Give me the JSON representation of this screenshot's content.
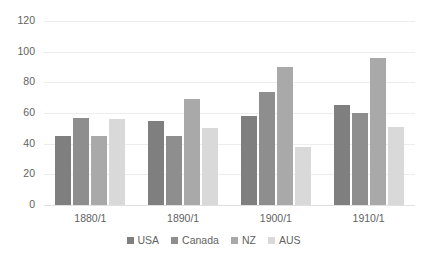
{
  "chart_data": {
    "type": "bar",
    "title": "",
    "subtitle": "",
    "xlabel": "",
    "ylabel": "",
    "categories": [
      "1880/1",
      "1890/1",
      "1900/1",
      "1910/1"
    ],
    "series": [
      {
        "name": "USA",
        "color": "#7f7f7f",
        "values": [
          45,
          55,
          58,
          65
        ]
      },
      {
        "name": "Canada",
        "color": "#8e8e8e",
        "values": [
          57,
          45,
          74,
          60
        ]
      },
      {
        "name": "NZ",
        "color": "#a9a9a9",
        "values": [
          45,
          69,
          90,
          96
        ]
      },
      {
        "name": "AUS",
        "color": "#d9d9d9",
        "values": [
          56,
          50,
          38,
          51
        ]
      }
    ],
    "ylim": [
      0,
      120
    ],
    "yticks": [
      0,
      20,
      40,
      60,
      80,
      100,
      120
    ],
    "ytick_labels": [
      "0",
      "20",
      "40",
      "60",
      "80",
      "100",
      "120"
    ],
    "grid": true,
    "grid_color": "#ededed",
    "legend_position": "bottom",
    "background_color": "#ffffff",
    "text_color": "#626262"
  }
}
